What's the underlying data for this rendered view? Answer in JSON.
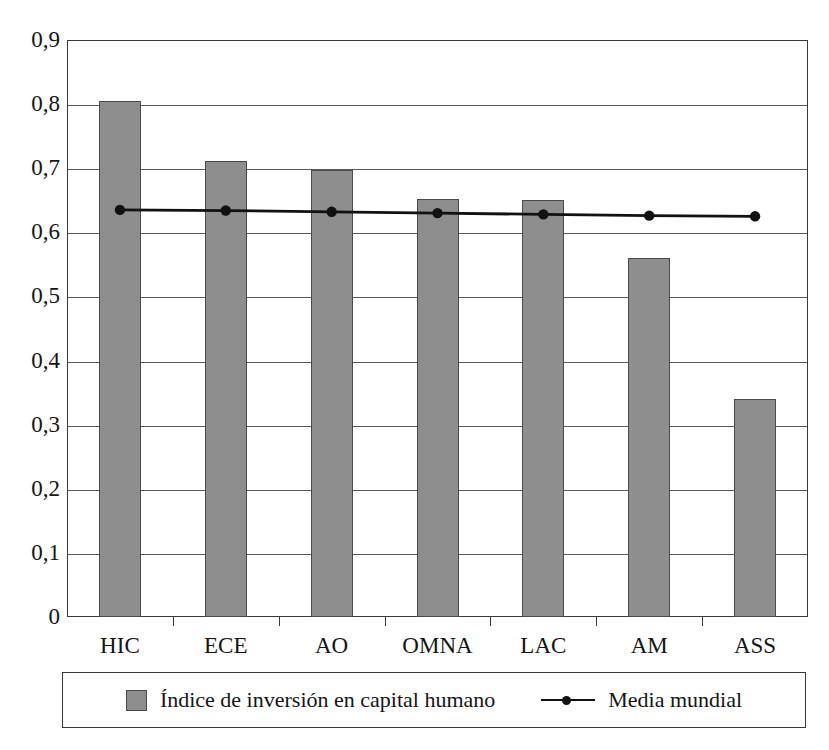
{
  "chart_data": {
    "type": "bar",
    "title": "",
    "xlabel": "",
    "ylabel": "",
    "categories": [
      "HIC",
      "ECE",
      "AO",
      "OMNA",
      "LAC",
      "AM",
      "ASS"
    ],
    "ylim": [
      0,
      0.9
    ],
    "ytick_labels": [
      "0,9",
      "0,8",
      "0,7",
      "0,6",
      "0,5",
      "0,4",
      "0,3",
      "0,2",
      "0,1",
      "0"
    ],
    "ytick_values": [
      0.9,
      0.8,
      0.7,
      0.6,
      0.5,
      0.4,
      0.3,
      0.2,
      0.1,
      0
    ],
    "grid": true,
    "legend_position": "bottom",
    "decimal_separator": ",",
    "series": [
      {
        "name": "Índice de inversión en capital humano",
        "type": "bar",
        "color": "#8e8e8e",
        "values": [
          0.805,
          0.711,
          0.698,
          0.652,
          0.651,
          0.56,
          0.34
        ]
      },
      {
        "name": "Media mundial",
        "type": "line",
        "color": "#111111",
        "values": [
          0.635,
          0.634,
          0.632,
          0.63,
          0.628,
          0.626,
          0.625
        ]
      }
    ]
  },
  "legend": {
    "entries": [
      {
        "label": "Índice de inversión en capital humano",
        "marker": "square-swatch"
      },
      {
        "label": "Media mundial",
        "marker": "line-with-dot"
      }
    ]
  },
  "colors": {
    "bar_fill": "#8e8e8e",
    "bar_stroke": "#4a4a4a",
    "line": "#111111",
    "axis": "#3a3a3a",
    "grid": "#5a5a5a",
    "background": "#ffffff"
  }
}
